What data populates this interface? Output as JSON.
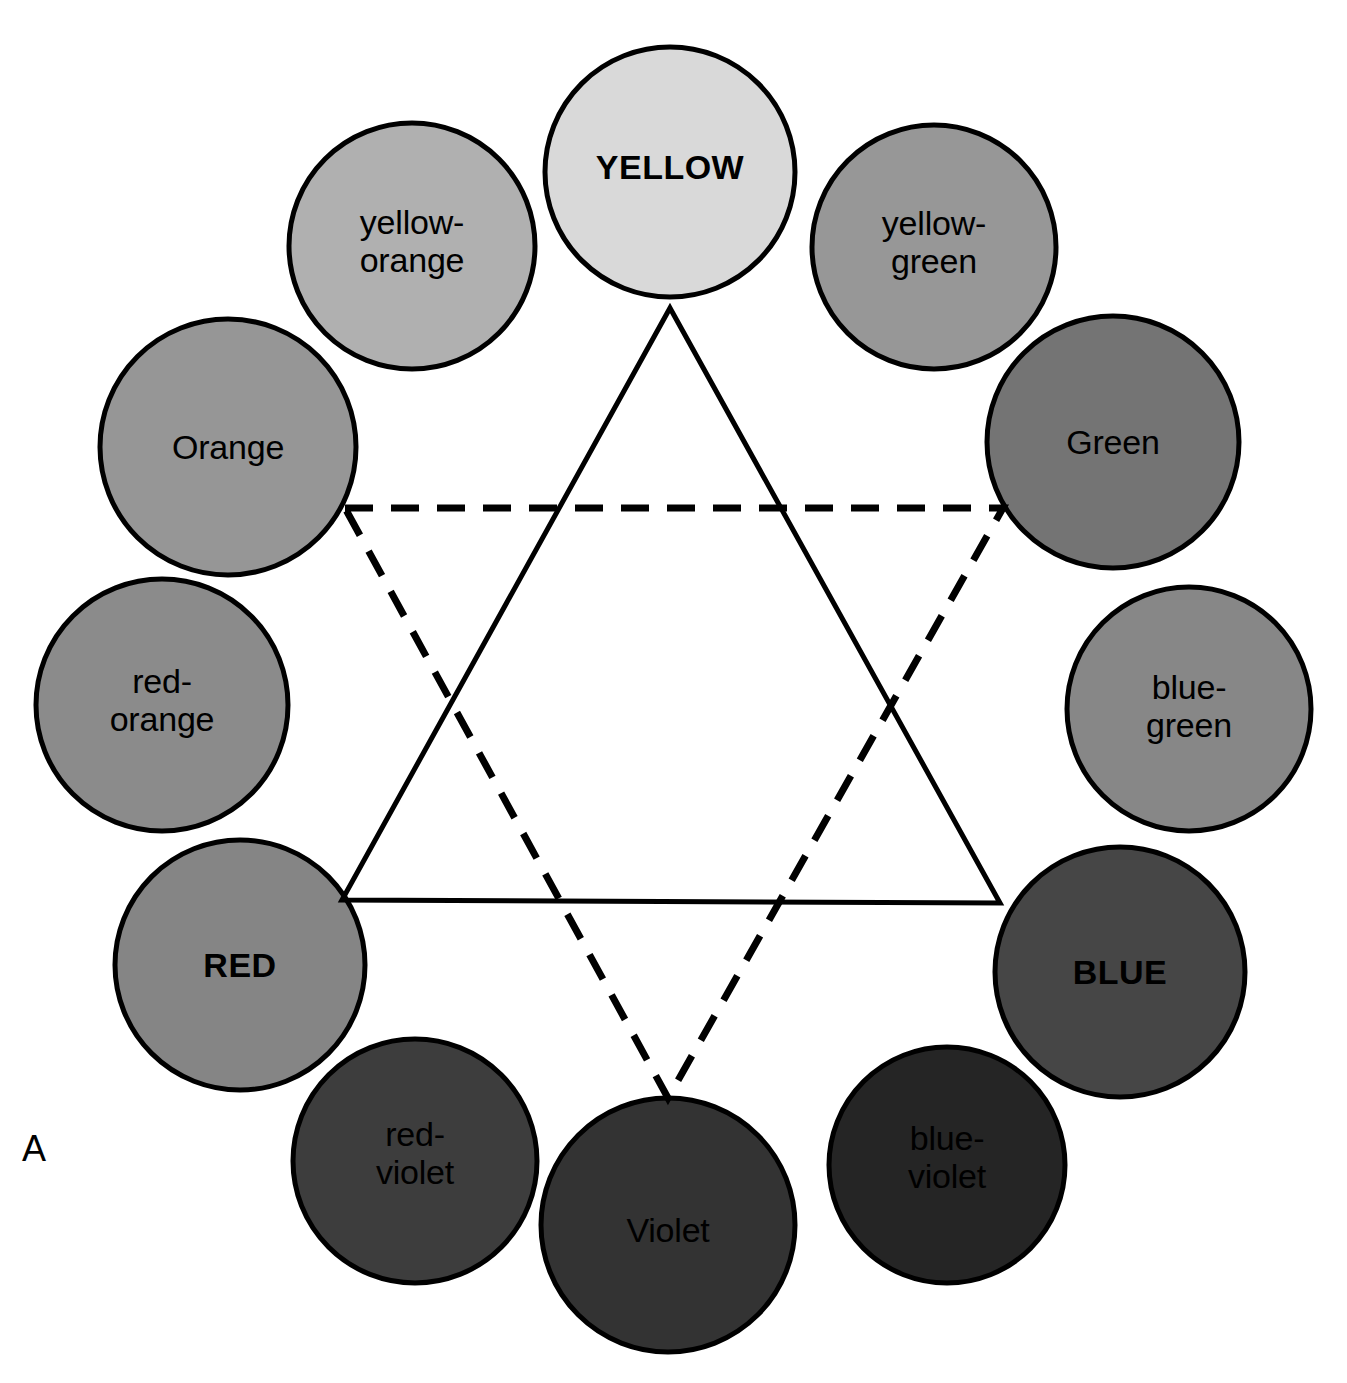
{
  "figure": {
    "panel_letter": "A",
    "background_color": "#ffffff",
    "outline_color": "#000000",
    "canvas": {
      "width": 1347,
      "height": 1383
    }
  },
  "wheel": {
    "center": {
      "x": 672,
      "y": 700
    },
    "ring_radius": 470,
    "swatches": [
      {
        "name": "yellow",
        "label": "YELLOW",
        "category": "primary",
        "fill": "#d9d9d9",
        "cx": 670,
        "cy": 172,
        "r": 125,
        "label_dy": -5
      },
      {
        "name": "yellow-green",
        "label": "yellow-\ngreen",
        "category": "tertiary",
        "fill": "#979797",
        "cx": 934,
        "cy": 247,
        "r": 122,
        "label_dy": -5
      },
      {
        "name": "green",
        "label": "Green",
        "category": "secondary",
        "fill": "#747474",
        "cx": 1113,
        "cy": 442,
        "r": 126,
        "label_dy": 0
      },
      {
        "name": "blue-green",
        "label": "blue-\ngreen",
        "category": "tertiary",
        "fill": "#878787",
        "cx": 1189,
        "cy": 709,
        "r": 122,
        "label_dy": -3
      },
      {
        "name": "blue",
        "label": "BLUE",
        "category": "primary",
        "fill": "#464646",
        "cx": 1120,
        "cy": 972,
        "r": 125,
        "label_dy": 0
      },
      {
        "name": "blue-violet",
        "label": "blue-\nviolet",
        "category": "tertiary",
        "fill": "#252525",
        "cx": 947,
        "cy": 1165,
        "r": 118,
        "label_dy": -8
      },
      {
        "name": "violet",
        "label": "Violet",
        "category": "secondary",
        "fill": "#333333",
        "cx": 668,
        "cy": 1225,
        "r": 127,
        "label_dy": 5
      },
      {
        "name": "red-violet",
        "label": "red-\nviolet",
        "category": "tertiary",
        "fill": "#3d3d3d",
        "cx": 415,
        "cy": 1161,
        "r": 122,
        "label_dy": -8
      },
      {
        "name": "red",
        "label": "RED",
        "category": "primary",
        "fill": "#858585",
        "cx": 240,
        "cy": 965,
        "r": 125,
        "label_dy": 0
      },
      {
        "name": "red-orange",
        "label": "red-\norange",
        "category": "tertiary",
        "fill": "#8b8b8b",
        "cx": 162,
        "cy": 705,
        "r": 126,
        "label_dy": -5
      },
      {
        "name": "orange",
        "label": "Orange",
        "category": "secondary",
        "fill": "#969696",
        "cx": 228,
        "cy": 447,
        "r": 128,
        "label_dy": 0
      },
      {
        "name": "yellow-orange",
        "label": "yellow-\norange",
        "category": "tertiary",
        "fill": "#b0b0b0",
        "cx": 412,
        "cy": 246,
        "r": 123,
        "label_dy": -5
      }
    ],
    "triangles": [
      {
        "name": "primary-triad",
        "style": "solid",
        "vertex_swatches": [
          "yellow",
          "blue",
          "red"
        ],
        "points": "670,308 1000,903 342,900",
        "stroke_width": 5
      },
      {
        "name": "secondary-triad",
        "style": "dashed",
        "vertex_swatches": [
          "orange",
          "green",
          "violet"
        ],
        "points": "345,508 1003,508 668,1098",
        "stroke_width": 7,
        "dash_pattern": "28,18"
      }
    ]
  },
  "chart_data": {
    "type": "diagram",
    "wheel_positions": [
      {
        "hue": "YELLOW",
        "angle_deg": 90,
        "tier": "primary",
        "gray_value": "#d9d9d9"
      },
      {
        "hue": "yellow-green",
        "angle_deg": 60,
        "tier": "tertiary",
        "gray_value": "#979797"
      },
      {
        "hue": "Green",
        "angle_deg": 30,
        "tier": "secondary",
        "gray_value": "#747474"
      },
      {
        "hue": "blue-green",
        "angle_deg": 0,
        "tier": "tertiary",
        "gray_value": "#878787"
      },
      {
        "hue": "BLUE",
        "angle_deg": -30,
        "tier": "primary",
        "gray_value": "#464646"
      },
      {
        "hue": "blue-violet",
        "angle_deg": -60,
        "tier": "tertiary",
        "gray_value": "#252525"
      },
      {
        "hue": "Violet",
        "angle_deg": -90,
        "tier": "secondary",
        "gray_value": "#333333"
      },
      {
        "hue": "red-violet",
        "angle_deg": -120,
        "tier": "tertiary",
        "gray_value": "#3d3d3d"
      },
      {
        "hue": "RED",
        "angle_deg": -150,
        "tier": "primary",
        "gray_value": "#858585"
      },
      {
        "hue": "red-orange",
        "angle_deg": 180,
        "tier": "tertiary",
        "gray_value": "#8b8b8b"
      },
      {
        "hue": "Orange",
        "angle_deg": 150,
        "tier": "secondary",
        "gray_value": "#969696"
      },
      {
        "hue": "yellow-orange",
        "angle_deg": 120,
        "tier": "tertiary",
        "gray_value": "#b0b0b0"
      }
    ],
    "triads": [
      {
        "name": "primary triad",
        "line_style": "solid",
        "members": [
          "YELLOW",
          "RED",
          "BLUE"
        ]
      },
      {
        "name": "secondary triad",
        "line_style": "dashed",
        "members": [
          "Orange",
          "Green",
          "Violet"
        ]
      }
    ]
  }
}
